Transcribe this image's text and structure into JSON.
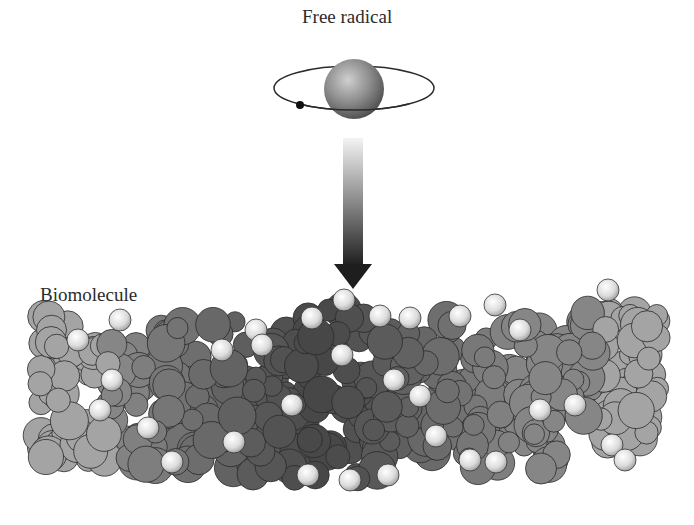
{
  "labels": {
    "free_radical": "Free radical",
    "biomolecule": "Biomolecule"
  },
  "colors": {
    "background": "#ffffff",
    "text": "#2b2b2b",
    "atom_dark": "#5a5a5a",
    "atom_mid": "#7a7a7a",
    "atom_light": "#9a9a9a",
    "hydrogen": "#e6e6e6",
    "arrow_top": "#f2f2f2",
    "arrow_bottom": "#1e1e1e"
  },
  "diagram": {
    "elements": [
      "free radical atom with orbiting electron",
      "downward gradient arrow",
      "space-filling biomolecule model"
    ]
  }
}
